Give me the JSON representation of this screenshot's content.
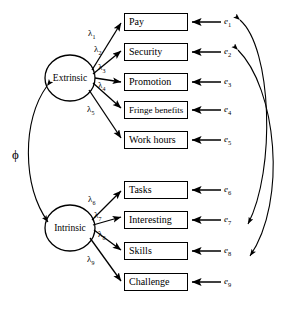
{
  "diagram": {
    "type": "structural-equation-model-path-diagram",
    "title": "",
    "width": 297,
    "height": 316,
    "stroke_color": "#000000",
    "background_color": "#ffffff"
  },
  "latent_factors": [
    {
      "id": "extrinsic",
      "label": "Extrinsic",
      "cx": 70,
      "cy": 78,
      "rx": 25,
      "ry": 23
    },
    {
      "id": "intrinsic",
      "label": "Intrinsic",
      "cx": 70,
      "cy": 228,
      "rx": 25,
      "ry": 23
    }
  ],
  "observed_variables": [
    {
      "id": "pay",
      "label": "Pay",
      "x": 124,
      "y": 13,
      "w": 64,
      "factor": "extrinsic",
      "error": "e1"
    },
    {
      "id": "security",
      "label": "Security",
      "x": 124,
      "y": 43,
      "w": 64,
      "factor": "extrinsic",
      "error": "e2"
    },
    {
      "id": "promotion",
      "label": "Promotion",
      "x": 124,
      "y": 73,
      "w": 64,
      "factor": "extrinsic",
      "error": "e3"
    },
    {
      "id": "fringe-benefits",
      "label": "Fringe benefits",
      "x": 124,
      "y": 101,
      "w": 64,
      "factor": "extrinsic",
      "error": "e4"
    },
    {
      "id": "work-hours",
      "label": "Work hours",
      "x": 124,
      "y": 131,
      "w": 64,
      "factor": "extrinsic",
      "error": "e5"
    },
    {
      "id": "tasks",
      "label": "Tasks",
      "x": 124,
      "y": 181,
      "w": 64,
      "factor": "intrinsic",
      "error": "e6"
    },
    {
      "id": "interesting",
      "label": "Interesting",
      "x": 124,
      "y": 211,
      "w": 64,
      "factor": "intrinsic",
      "error": "e7"
    },
    {
      "id": "skills",
      "label": "Skills",
      "x": 124,
      "y": 242,
      "w": 64,
      "factor": "intrinsic",
      "error": "e8"
    },
    {
      "id": "challenge",
      "label": "Challenge",
      "x": 124,
      "y": 273,
      "w": 64,
      "factor": "intrinsic",
      "error": "e9"
    }
  ],
  "error_terms": [
    {
      "id": "e1",
      "symbol": "e",
      "subscript": "1",
      "x": 224,
      "y": 16
    },
    {
      "id": "e2",
      "symbol": "e",
      "subscript": "2",
      "x": 224,
      "y": 46
    },
    {
      "id": "e3",
      "symbol": "e",
      "subscript": "3",
      "x": 224,
      "y": 76
    },
    {
      "id": "e4",
      "symbol": "e",
      "subscript": "4",
      "x": 224,
      "y": 104
    },
    {
      "id": "e5",
      "symbol": "e",
      "subscript": "5",
      "x": 224,
      "y": 134
    },
    {
      "id": "e6",
      "symbol": "e",
      "subscript": "6",
      "x": 224,
      "y": 184
    },
    {
      "id": "e7",
      "symbol": "e",
      "subscript": "7",
      "x": 224,
      "y": 214
    },
    {
      "id": "e8",
      "symbol": "e",
      "subscript": "8",
      "x": 224,
      "y": 245
    },
    {
      "id": "e9",
      "symbol": "e",
      "subscript": "9",
      "x": 224,
      "y": 276
    }
  ],
  "loadings": [
    {
      "id": "lambda1",
      "symbol": "λ",
      "subscript": "1",
      "from": "extrinsic",
      "to": "pay",
      "x": 88,
      "y": 28
    },
    {
      "id": "lambda2",
      "symbol": "λ",
      "subscript": "2",
      "from": "extrinsic",
      "to": "security",
      "x": 94,
      "y": 44
    },
    {
      "id": "lambda3",
      "symbol": "λ",
      "subscript": "3",
      "from": "extrinsic",
      "to": "promotion",
      "x": 98,
      "y": 63
    },
    {
      "id": "lambda4",
      "symbol": "λ",
      "subscript": "4",
      "from": "extrinsic",
      "to": "fringe-benefits",
      "x": 98,
      "y": 81
    },
    {
      "id": "lambda5",
      "symbol": "λ",
      "subscript": "5",
      "from": "extrinsic",
      "to": "work-hours",
      "x": 88,
      "y": 106
    },
    {
      "id": "lambda6",
      "symbol": "λ",
      "subscript": "6",
      "from": "intrinsic",
      "to": "tasks",
      "x": 88,
      "y": 194
    },
    {
      "id": "lambda7",
      "symbol": "λ",
      "subscript": "7",
      "from": "intrinsic",
      "to": "interesting",
      "x": 94,
      "y": 211
    },
    {
      "id": "lambda8",
      "symbol": "λ",
      "subscript": "8",
      "from": "intrinsic",
      "to": "skills",
      "x": 98,
      "y": 230
    },
    {
      "id": "lambda9",
      "symbol": "λ",
      "subscript": "9",
      "from": "intrinsic",
      "to": "challenge",
      "x": 88,
      "y": 256
    }
  ],
  "factor_covariance": {
    "id": "phi",
    "symbol": "ϕ",
    "between": [
      "extrinsic",
      "intrinsic"
    ],
    "label_x": 12,
    "label_y": 148,
    "double_headed": true
  },
  "error_correlations": [
    {
      "id": "corr-e1-e7",
      "between": [
        "e1",
        "e7"
      ],
      "double_headed": true
    },
    {
      "id": "corr-e2-e8",
      "between": [
        "e2",
        "e8"
      ],
      "double_headed": true
    }
  ]
}
